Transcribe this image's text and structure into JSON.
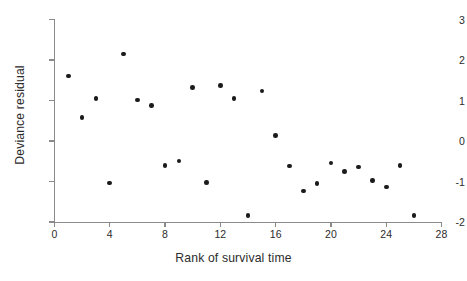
{
  "chart_data": {
    "type": "scatter",
    "title": "",
    "xlabel": "Rank of survival time",
    "ylabel": "Deviance residual",
    "xlim": [
      0,
      28
    ],
    "ylim": [
      -2,
      3
    ],
    "xticks": [
      0,
      4,
      8,
      12,
      16,
      20,
      24,
      28
    ],
    "yticks": [
      -2,
      -1,
      0,
      1,
      2,
      3
    ],
    "xtick_labels": [
      "0",
      "4",
      "8",
      "12",
      "16",
      "20",
      "24",
      "28"
    ],
    "ytick_labels": [
      "-2",
      "-1",
      "0",
      "1",
      "2",
      "3"
    ],
    "grid": false,
    "legend": null,
    "marker": "filled-circle",
    "marker_color": "#1b1b1b",
    "axis_color": "#8a8a8a",
    "background": "#ffffff",
    "x": [
      1,
      2,
      3,
      4,
      5,
      6,
      7,
      8,
      9,
      10,
      11,
      12,
      13,
      14,
      15,
      16,
      17,
      18,
      19,
      20,
      21,
      22,
      23,
      24,
      25,
      26
    ],
    "y": [
      1.6,
      0.58,
      1.05,
      -1.04,
      2.15,
      1.01,
      0.87,
      -0.61,
      -0.49,
      1.32,
      -1.02,
      1.37,
      1.05,
      -1.84,
      1.23,
      0.13,
      -0.62,
      -1.23,
      -1.05,
      -0.54,
      -0.75,
      -0.64,
      -0.98,
      -1.14,
      -0.6,
      -1.84
    ],
    "points": [
      {
        "x": 1,
        "y": 1.6
      },
      {
        "x": 2,
        "y": 0.58
      },
      {
        "x": 3,
        "y": 1.05
      },
      {
        "x": 4,
        "y": -1.04
      },
      {
        "x": 5,
        "y": 2.15
      },
      {
        "x": 6,
        "y": 1.01
      },
      {
        "x": 7,
        "y": 0.87
      },
      {
        "x": 8,
        "y": -0.61
      },
      {
        "x": 9,
        "y": -0.49
      },
      {
        "x": 10,
        "y": 1.32
      },
      {
        "x": 11,
        "y": -1.02
      },
      {
        "x": 12,
        "y": 1.37
      },
      {
        "x": 13,
        "y": 1.05
      },
      {
        "x": 14,
        "y": -1.84
      },
      {
        "x": 15,
        "y": 1.23
      },
      {
        "x": 16,
        "y": 0.13
      },
      {
        "x": 17,
        "y": -0.62
      },
      {
        "x": 18,
        "y": -1.23
      },
      {
        "x": 19,
        "y": -1.05
      },
      {
        "x": 20,
        "y": -0.54
      },
      {
        "x": 21,
        "y": -0.75
      },
      {
        "x": 22,
        "y": -0.64
      },
      {
        "x": 23,
        "y": -0.98
      },
      {
        "x": 24,
        "y": -1.14
      },
      {
        "x": 25,
        "y": -0.6
      },
      {
        "x": 26,
        "y": -1.84
      }
    ]
  }
}
